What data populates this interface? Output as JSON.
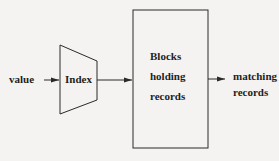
{
  "diagram": {
    "input_label": "value",
    "index_label": "Index",
    "blocks_label_lines": [
      "Blocks",
      "holding",
      "records"
    ],
    "output_label_lines": [
      "matching",
      "records"
    ],
    "stroke_color": "#2a2a2a",
    "background_color": "#f4f3f1"
  }
}
